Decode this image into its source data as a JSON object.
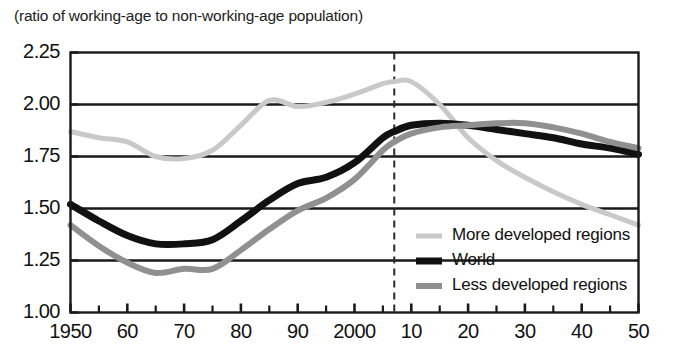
{
  "chart_data": {
    "type": "line",
    "title": "(ratio of working-age to non-working-age population)",
    "xlabel": "",
    "ylabel": "",
    "xlim": [
      1950,
      2050
    ],
    "ylim": [
      1.0,
      2.25
    ],
    "ytick_values": [
      2.25,
      2.0,
      1.75,
      1.5,
      1.25,
      1.0
    ],
    "ytick_labels": [
      "2.25",
      "2.00",
      "1.75",
      "1.50",
      "1.25",
      "1.00"
    ],
    "xtick_values": [
      1950,
      1960,
      1970,
      1980,
      1990,
      2000,
      2010,
      2020,
      2030,
      2040,
      2050
    ],
    "xtick_labels": [
      "1950",
      "60",
      "70",
      "80",
      "90",
      "2000",
      "10",
      "20",
      "30",
      "40",
      "50"
    ],
    "minor_xtick_step": 5,
    "grid": "horizontal",
    "legend_position": "inside-lower-right",
    "annotations": [
      {
        "type": "vertical-dashed-line",
        "x": 2007,
        "label": ""
      }
    ],
    "series": [
      {
        "name": "More developed regions",
        "color": "#c9c9c9",
        "width": 5,
        "x": [
          1950,
          1955,
          1960,
          1965,
          1970,
          1975,
          1980,
          1985,
          1990,
          1995,
          2000,
          2005,
          2007,
          2010,
          2015,
          2020,
          2025,
          2030,
          2035,
          2040,
          2045,
          2050
        ],
        "values": [
          1.87,
          1.84,
          1.82,
          1.75,
          1.74,
          1.78,
          1.9,
          2.02,
          1.99,
          2.01,
          2.05,
          2.1,
          2.11,
          2.11,
          2.0,
          1.84,
          1.73,
          1.65,
          1.58,
          1.52,
          1.47,
          1.42
        ]
      },
      {
        "name": "World",
        "color": "#111111",
        "width": 7,
        "x": [
          1950,
          1955,
          1960,
          1965,
          1970,
          1975,
          1980,
          1985,
          1990,
          1995,
          2000,
          2005,
          2007,
          2010,
          2015,
          2020,
          2025,
          2030,
          2035,
          2040,
          2045,
          2050
        ],
        "values": [
          1.52,
          1.44,
          1.37,
          1.33,
          1.33,
          1.35,
          1.44,
          1.54,
          1.62,
          1.65,
          1.72,
          1.84,
          1.87,
          1.9,
          1.91,
          1.9,
          1.88,
          1.86,
          1.84,
          1.81,
          1.79,
          1.76
        ]
      },
      {
        "name": "Less developed regions",
        "color": "#909090",
        "width": 6,
        "x": [
          1950,
          1955,
          1960,
          1965,
          1970,
          1975,
          1980,
          1985,
          1990,
          1995,
          2000,
          2005,
          2007,
          2010,
          2015,
          2020,
          2025,
          2030,
          2035,
          2040,
          2045,
          2050
        ],
        "values": [
          1.42,
          1.32,
          1.24,
          1.19,
          1.21,
          1.21,
          1.3,
          1.4,
          1.49,
          1.55,
          1.64,
          1.78,
          1.82,
          1.86,
          1.89,
          1.9,
          1.91,
          1.91,
          1.89,
          1.86,
          1.82,
          1.79
        ]
      }
    ]
  },
  "legend": {
    "items": [
      {
        "label": "More developed regions",
        "color": "#c9c9c9",
        "thickness": 5
      },
      {
        "label": "World",
        "color": "#111111",
        "thickness": 7
      },
      {
        "label": "Less developed regions",
        "color": "#909090",
        "thickness": 6
      }
    ]
  }
}
